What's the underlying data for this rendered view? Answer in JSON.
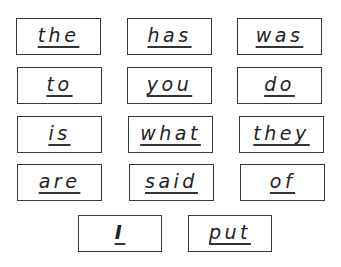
{
  "worksheet": {
    "words": [
      {
        "text": "the"
      },
      {
        "text": "has"
      },
      {
        "text": "was"
      },
      {
        "text": "to"
      },
      {
        "text": "you"
      },
      {
        "text": "do"
      },
      {
        "text": "is"
      },
      {
        "text": "what"
      },
      {
        "text": "they"
      },
      {
        "text": "are"
      },
      {
        "text": "said"
      },
      {
        "text": "of"
      },
      {
        "text": "I"
      },
      {
        "text": "put"
      }
    ]
  }
}
